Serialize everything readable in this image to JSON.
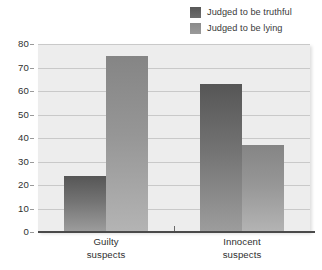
{
  "chart_data": {
    "type": "bar",
    "title": "",
    "subtitle": "",
    "xlabel": "",
    "ylabel": "",
    "ylim": [
      0,
      80
    ],
    "yticks": [
      0,
      10,
      20,
      30,
      40,
      50,
      60,
      70,
      80
    ],
    "ytick_labels": [
      "0",
      "10",
      "20",
      "30",
      "40",
      "50",
      "60",
      "70",
      "80"
    ],
    "grid": true,
    "legend_position": "top-right",
    "categories": [
      "Guilty suspects",
      "Innocent suspects"
    ],
    "category_lines": [
      [
        "Guilty",
        "suspects"
      ],
      [
        "Innocent",
        "suspects"
      ]
    ],
    "series": [
      {
        "name": "Judged to be truthful",
        "color": "#565656",
        "values": [
          24,
          63
        ]
      },
      {
        "name": "Judged to be lying",
        "color": "#858585",
        "values": [
          75,
          37
        ]
      }
    ],
    "annotations": []
  },
  "legend": {
    "items": [
      {
        "label": "Judged to be truthful",
        "swatch": "legend-swatch-truthful"
      },
      {
        "label": "Judged to be lying",
        "swatch": "legend-swatch-lying"
      }
    ]
  },
  "colors": {
    "plot_background": "#ededed",
    "page_background": "#ffffff",
    "gridline": "#c9c9c9",
    "axis": "#4a4a4a",
    "text": "#2f2f2f",
    "series_truthful": "#565656",
    "series_lying": "#858585"
  }
}
